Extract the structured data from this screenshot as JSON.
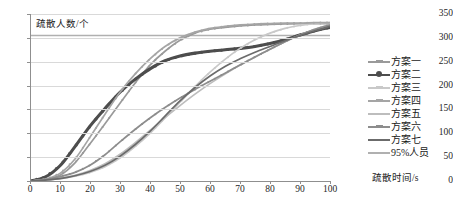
{
  "chart_data": {
    "type": "line",
    "title": "",
    "xlabel": "疏散时间/s",
    "ylabel": "疏散人数/个",
    "xlim": [
      0,
      100
    ],
    "ylim": [
      0,
      350
    ],
    "xticks": [
      0,
      10,
      20,
      30,
      40,
      50,
      60,
      70,
      80,
      90,
      100
    ],
    "yticks": [
      0,
      50,
      100,
      150,
      200,
      250,
      300,
      350
    ],
    "grid": true,
    "legend_position": "right",
    "reference_lines": [
      {
        "name": "95%人员",
        "orientation": "horizontal",
        "value": 305,
        "color": "#b0b0b0"
      }
    ],
    "x": [
      0,
      5,
      10,
      15,
      20,
      25,
      30,
      35,
      40,
      45,
      50,
      55,
      60,
      65,
      70,
      75,
      80,
      85,
      90,
      95,
      100
    ],
    "series": [
      {
        "name": "方案一",
        "color": "#9a9a9a",
        "marker": "cross",
        "values": [
          0,
          3,
          12,
          38,
          78,
          120,
          163,
          205,
          243,
          272,
          295,
          310,
          318,
          322,
          325,
          327,
          328,
          329,
          330,
          330,
          330
        ]
      },
      {
        "name": "方案二",
        "color": "#4d4d4d",
        "marker": "dot",
        "values": [
          0,
          8,
          32,
          72,
          115,
          152,
          186,
          213,
          235,
          252,
          262,
          268,
          272,
          275,
          278,
          282,
          288,
          296,
          306,
          315,
          322
        ]
      },
      {
        "name": "方案三",
        "color": "#c9c9c9",
        "marker": "cross",
        "values": [
          0,
          2,
          5,
          10,
          18,
          30,
          48,
          72,
          100,
          132,
          165,
          198,
          228,
          255,
          278,
          296,
          310,
          320,
          326,
          330,
          332
        ]
      },
      {
        "name": "方案四",
        "color": "#a5a5a5",
        "marker": "cross",
        "values": [
          0,
          4,
          16,
          46,
          92,
          140,
          186,
          224,
          256,
          282,
          300,
          312,
          320,
          324,
          327,
          329,
          330,
          331,
          331,
          332,
          332
        ]
      },
      {
        "name": "方案五",
        "color": "#bdbdbd",
        "marker": "line",
        "values": [
          0,
          2,
          6,
          12,
          22,
          36,
          56,
          80,
          106,
          133,
          158,
          182,
          204,
          224,
          243,
          260,
          276,
          292,
          306,
          318,
          328
        ]
      },
      {
        "name": "方案六",
        "color": "#8d8d8d",
        "marker": "cross",
        "values": [
          0,
          3,
          9,
          18,
          33,
          55,
          82,
          108,
          132,
          154,
          174,
          192,
          209,
          226,
          243,
          260,
          276,
          292,
          306,
          318,
          327
        ]
      },
      {
        "name": "方案七",
        "color": "#6b6b6b",
        "marker": "line",
        "values": [
          0,
          2,
          5,
          11,
          20,
          33,
          52,
          76,
          104,
          136,
          168,
          196,
          220,
          240,
          256,
          270,
          282,
          294,
          305,
          315,
          324
        ]
      }
    ]
  },
  "legend": {
    "items": [
      {
        "label": "方案一"
      },
      {
        "label": "方案二"
      },
      {
        "label": "方案三"
      },
      {
        "label": "方案四"
      },
      {
        "label": "方案五"
      },
      {
        "label": "方案六"
      },
      {
        "label": "方案七"
      },
      {
        "label": "95%人员"
      }
    ]
  },
  "axes": {
    "y_title": "疏散人数/个",
    "x_title": "疏散时间/s",
    "y_tick_labels": [
      "350",
      "300",
      "250",
      "200",
      "150",
      "100",
      "50",
      "0"
    ],
    "x_tick_labels": [
      "0",
      "10",
      "20",
      "30",
      "40",
      "50",
      "60",
      "70",
      "80",
      "90",
      "100"
    ]
  },
  "caption": ""
}
